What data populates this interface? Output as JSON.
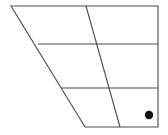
{
  "figure": {
    "canvas": {
      "width": 168,
      "height": 135,
      "background": "#ffffff"
    },
    "stroke_color": "#4a4a4a",
    "stroke_width": 1.1,
    "fill_color": "#ffffff",
    "marker_color": "#111111",
    "outline": {
      "name": "trapezoid-outline",
      "points": "11,6 158,6 158,127 85,127",
      "vertices": [
        {
          "label": "top-left",
          "x": 11,
          "y": 6
        },
        {
          "label": "top-right",
          "x": 158,
          "y": 6
        },
        {
          "label": "bottom-right",
          "x": 158,
          "y": 127
        },
        {
          "label": "bottom-left",
          "x": 85,
          "y": 127
        }
      ]
    },
    "interior_lines": [
      {
        "name": "horizontal-divider-upper",
        "x1": 38,
        "y1": 44,
        "x2": 158,
        "y2": 44
      },
      {
        "name": "horizontal-divider-lower",
        "x1": 61,
        "y1": 88,
        "x2": 158,
        "y2": 88
      },
      {
        "name": "interior-diagonal",
        "x1": 86,
        "y1": 6,
        "x2": 120,
        "y2": 127
      }
    ],
    "marker": {
      "name": "marker-dot",
      "cx": 149,
      "cy": 115,
      "r": 4.2
    },
    "cells": [
      {
        "name": "cell-top-left"
      },
      {
        "name": "cell-top-right"
      },
      {
        "name": "cell-middle-left"
      },
      {
        "name": "cell-middle-right"
      },
      {
        "name": "cell-bottom-left"
      },
      {
        "name": "cell-bottom-right"
      }
    ]
  }
}
